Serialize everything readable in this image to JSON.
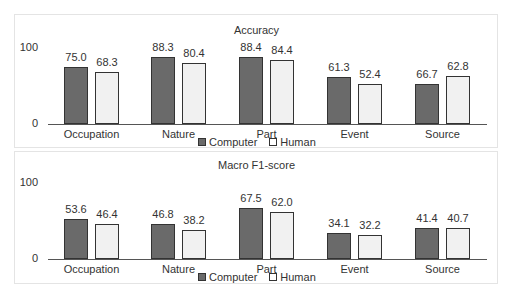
{
  "chart_data": [
    {
      "type": "bar",
      "title": "Accuracy",
      "categories": [
        "Occupation",
        "Nature",
        "Part",
        "Event",
        "Source"
      ],
      "series": [
        {
          "name": "Computer",
          "values": [
            75.0,
            88.3,
            88.4,
            61.3,
            52.4
          ],
          "color": "#6a6a6a"
        },
        {
          "name": "Human",
          "values": [
            68.3,
            80.4,
            84.4,
            52.4,
            62.8
          ],
          "color": "#f1f1f1"
        }
      ],
      "yticks": [
        "0",
        "100"
      ],
      "ylim": [
        0,
        100
      ],
      "xlabel": "",
      "ylabel": "",
      "grid": false,
      "legend_position": "bottom"
    },
    {
      "type": "bar",
      "title": "Macro F1-score",
      "categories": [
        "Occupation",
        "Nature",
        "Part",
        "Event",
        "Source"
      ],
      "series": [
        {
          "name": "Computer",
          "values": [
            53.6,
            46.8,
            67.5,
            34.1,
            41.4
          ],
          "color": "#6a6a6a"
        },
        {
          "name": "Human",
          "values": [
            46.4,
            38.2,
            62.0,
            32.2,
            40.7
          ],
          "color": "#f1f1f1"
        }
      ],
      "yticks": [
        "0",
        "100"
      ],
      "ylim": [
        0,
        100
      ],
      "xlabel": "",
      "ylabel": "",
      "grid": false,
      "legend_position": "bottom"
    }
  ],
  "panels": [
    {
      "title": "Accuracy",
      "ytick_top": "100",
      "ytick_bottom": "0",
      "categories": [
        "Occupation",
        "Nature",
        "Part",
        "Event",
        "Source"
      ],
      "computer_labels": [
        "75.0",
        "88.3",
        "88.4",
        "61.3",
        "66.7"
      ],
      "human_labels": [
        "68.3",
        "80.4",
        "84.4",
        "52.4",
        "62.8"
      ],
      "legend": {
        "computer": "Computer",
        "human": "Human"
      }
    },
    {
      "title": "Macro F1-score",
      "ytick_top": "100",
      "ytick_bottom": "0",
      "categories": [
        "Occupation",
        "Nature",
        "Part",
        "Event",
        "Source"
      ],
      "computer_labels": [
        "53.6",
        "46.8",
        "67.5",
        "34.1",
        "41.4"
      ],
      "human_labels": [
        "46.4",
        "38.2",
        "62.0",
        "32.2",
        "40.7"
      ],
      "legend": {
        "computer": "Computer",
        "human": "Human"
      }
    }
  ]
}
